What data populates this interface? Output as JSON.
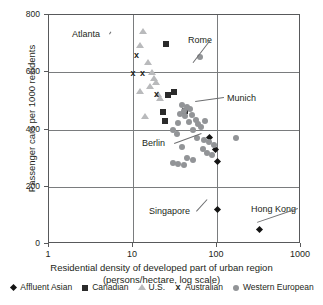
{
  "chart_data": {
    "type": "scatter",
    "title": "",
    "xlabel": "Residential density of developed part of urban region (persons/hectare, log scale)",
    "xlabel_line1": "Residential density of developed part of urban region",
    "xlabel_line2": "(persons/hectare, log scale)",
    "ylabel": "Passenger cars per 1000 residents",
    "xscale": "log",
    "xlim": [
      1,
      1000
    ],
    "ylim": [
      0,
      800
    ],
    "xticks": [
      1,
      10,
      100,
      1000
    ],
    "xtick_labels": [
      "1",
      "10",
      "100",
      "1000"
    ],
    "yticks": [
      0,
      200,
      400,
      600,
      800
    ],
    "ytick_labels": [
      "0",
      "200",
      "400",
      "600",
      "800"
    ],
    "grid": "both",
    "legend_position": "below",
    "series": [
      {
        "name": "Affluent Asian",
        "marker": "diamond",
        "color": "#141414",
        "points": [
          {
            "x": 82,
            "y": 372
          },
          {
            "x": 96,
            "y": 330
          },
          {
            "x": 100,
            "y": 287
          },
          {
            "x": 100,
            "y": 122
          },
          {
            "x": 320,
            "y": 52
          }
        ]
      },
      {
        "name": "Canadian",
        "marker": "square",
        "color": "#2b2b2b",
        "points": [
          {
            "x": 25,
            "y": 700
          },
          {
            "x": 31,
            "y": 532
          },
          {
            "x": 26,
            "y": 522
          },
          {
            "x": 23,
            "y": 462
          },
          {
            "x": 24,
            "y": 430
          },
          {
            "x": 42,
            "y": 466
          }
        ]
      },
      {
        "name": "U.S.",
        "marker": "triangle",
        "color": "#b9babc",
        "points": [
          {
            "x": 13,
            "y": 742
          },
          {
            "x": 12,
            "y": 690
          },
          {
            "x": 15,
            "y": 632
          },
          {
            "x": 17,
            "y": 598
          },
          {
            "x": 18,
            "y": 578
          },
          {
            "x": 19,
            "y": 562
          },
          {
            "x": 16,
            "y": 548
          },
          {
            "x": 12,
            "y": 532
          },
          {
            "x": 20,
            "y": 522
          },
          {
            "x": 21,
            "y": 505
          },
          {
            "x": 14,
            "y": 443
          }
        ]
      },
      {
        "name": "Australian",
        "marker": "x",
        "color": "#231f20",
        "points": [
          {
            "x": 11,
            "y": 658
          },
          {
            "x": 10,
            "y": 597
          },
          {
            "x": 13,
            "y": 594
          },
          {
            "x": 19,
            "y": 522
          }
        ]
      },
      {
        "name": "Western European",
        "marker": "circle",
        "color": "#929497",
        "points": [
          {
            "x": 62,
            "y": 655
          },
          {
            "x": 38,
            "y": 487
          },
          {
            "x": 44,
            "y": 478
          },
          {
            "x": 40,
            "y": 466
          },
          {
            "x": 48,
            "y": 470
          },
          {
            "x": 36,
            "y": 455
          },
          {
            "x": 42,
            "y": 447
          },
          {
            "x": 50,
            "y": 452
          },
          {
            "x": 56,
            "y": 432
          },
          {
            "x": 46,
            "y": 425
          },
          {
            "x": 34,
            "y": 424
          },
          {
            "x": 60,
            "y": 420
          },
          {
            "x": 65,
            "y": 410
          },
          {
            "x": 52,
            "y": 400
          },
          {
            "x": 30,
            "y": 398
          },
          {
            "x": 33,
            "y": 386
          },
          {
            "x": 72,
            "y": 430
          },
          {
            "x": 170,
            "y": 370
          },
          {
            "x": 58,
            "y": 372
          },
          {
            "x": 70,
            "y": 364
          },
          {
            "x": 80,
            "y": 358
          },
          {
            "x": 38,
            "y": 340
          },
          {
            "x": 68,
            "y": 332
          },
          {
            "x": 75,
            "y": 318
          },
          {
            "x": 88,
            "y": 312
          },
          {
            "x": 44,
            "y": 300
          },
          {
            "x": 52,
            "y": 292
          },
          {
            "x": 30,
            "y": 282
          },
          {
            "x": 34,
            "y": 278
          },
          {
            "x": 40,
            "y": 276
          },
          {
            "x": 92,
            "y": 345
          }
        ]
      }
    ],
    "annotations": [
      {
        "label": "Atlanta",
        "tx": 71,
        "ty": 28,
        "px": 110,
        "py": 30
      },
      {
        "label": "Rome",
        "tx": 187,
        "ty": 34,
        "px": 192,
        "py": 62
      },
      {
        "label": "Munich",
        "tx": 226,
        "ty": 92,
        "px": 194,
        "py": 101
      },
      {
        "label": "Berlin",
        "tx": 141,
        "ty": 137,
        "px": 201,
        "py": 132
      },
      {
        "label": "Singapore",
        "tx": 148,
        "ty": 205,
        "px": 206,
        "py": 198
      },
      {
        "label": "Hong Kong",
        "tx": 250,
        "ty": 203,
        "px": 256,
        "py": 222
      }
    ]
  }
}
